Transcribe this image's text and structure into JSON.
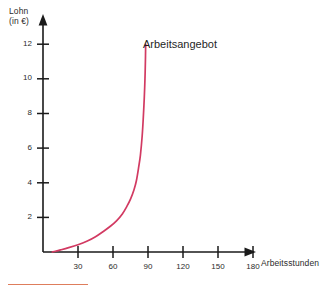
{
  "chart_data": {
    "type": "line",
    "title": "",
    "subtitle": "",
    "xlabel": "Arbeitsstunden",
    "ylabel": "Lohn",
    "ylabel_unit": "(in €)",
    "ylabel_line1": "Lohn",
    "ylabel_line2": "(in €)",
    "xlim": [
      0,
      195
    ],
    "ylim": [
      0,
      13
    ],
    "grid": false,
    "legend_position": "inline-annotation",
    "xticks": [
      30,
      60,
      90,
      120,
      150,
      180
    ],
    "xtick_labels": [
      "30",
      "60",
      "90",
      "120",
      "150",
      "180"
    ],
    "yticks": [
      2,
      4,
      6,
      8,
      10,
      12
    ],
    "ytick_labels": [
      "2",
      "4",
      "6",
      "8",
      "10",
      "12"
    ],
    "series": [
      {
        "name": "Arbeitsangebot",
        "color": "#d23a62",
        "annotation": "Arbeitsangebot",
        "x": [
          8,
          15,
          22,
          30,
          38,
          45,
          52,
          58,
          63,
          68,
          72,
          75,
          78,
          80,
          82,
          83.5,
          85,
          86,
          86.8,
          87.4,
          87.8,
          88
        ],
        "y": [
          0.0,
          0.12,
          0.25,
          0.42,
          0.63,
          0.88,
          1.2,
          1.5,
          1.8,
          2.2,
          2.65,
          3.05,
          3.6,
          4.1,
          4.9,
          5.6,
          6.7,
          7.8,
          8.9,
          10.0,
          11.1,
          12.0
        ]
      }
    ],
    "annotations": [
      {
        "text": "Arbeitsangebot",
        "x": 128,
        "y": 12
      }
    ]
  },
  "axes": {
    "x_arrow": true,
    "y_arrow": true,
    "axis_color": "#1a1a1a"
  },
  "colors": {
    "curve": "#d23a62",
    "axis": "#1a1a1a",
    "text": "#2b2b2b",
    "footer_rule": "#d8663f"
  },
  "footer": {
    "caption": ""
  }
}
